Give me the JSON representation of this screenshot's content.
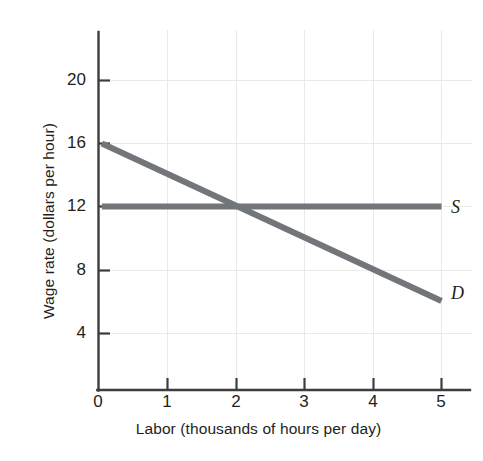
{
  "chart_data": {
    "type": "line",
    "title": "",
    "xlabel": "Labor (thousands of hours per day)",
    "ylabel": "Wage rate (dollars per hour)",
    "xlim": [
      0,
      5.35
    ],
    "ylim": [
      0,
      22.2
    ],
    "xticks": [
      "0",
      "1",
      "2",
      "3",
      "4",
      "5"
    ],
    "xtick_values": [
      0,
      1,
      2,
      3,
      4,
      5
    ],
    "yticks": [
      "4",
      "8",
      "12",
      "16",
      "20"
    ],
    "ytick_values": [
      4,
      8,
      12,
      16,
      20
    ],
    "grid": true,
    "grid_color": "#e8e8e8",
    "legend_position": "inline-right",
    "series": [
      {
        "name": "D",
        "label": "D",
        "description": "Labor demand curve",
        "color": "#72757a",
        "x": [
          0.05,
          5.0
        ],
        "y": [
          16.0,
          6.0
        ],
        "points": [
          [
            0,
            16
          ],
          [
            1,
            14
          ],
          [
            2,
            12
          ],
          [
            3,
            10
          ],
          [
            4,
            8
          ],
          [
            5,
            6
          ]
        ]
      },
      {
        "name": "S",
        "label": "S",
        "description": "Labor supply curve (minimum wage, perfectly elastic)",
        "color": "#72757a",
        "x": [
          0.05,
          5.0
        ],
        "y": [
          12.0,
          12.0
        ],
        "points": [
          [
            0,
            12
          ],
          [
            1,
            12
          ],
          [
            2,
            12
          ],
          [
            3,
            12
          ],
          [
            4,
            12
          ],
          [
            5,
            12
          ]
        ]
      }
    ],
    "equilibrium": {
      "labor": 2,
      "wage": 12
    },
    "annotations": [
      {
        "name": "supply-label",
        "text": "S",
        "x": 5.0,
        "y": 12.0
      },
      {
        "name": "demand-label",
        "text": "D",
        "x": 5.0,
        "y": 6.0
      }
    ],
    "colors": {
      "curve": "#72757a",
      "axis": "#3a3a3a",
      "grid": "#e8e8e8",
      "text": "#231f20",
      "background": "#ffffff"
    }
  }
}
